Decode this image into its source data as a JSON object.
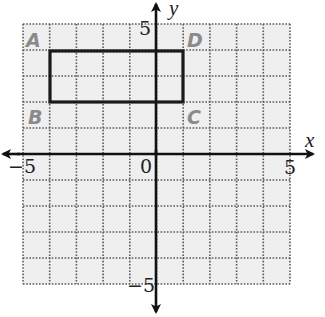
{
  "diagram": {
    "type": "coordinate-plane",
    "grid": {
      "x_range": [
        -5,
        5
      ],
      "y_range": [
        -5,
        5
      ],
      "step": 1,
      "background": "#efefef",
      "line_color": "#5a5a5a",
      "line_style": "dotted"
    },
    "axes": {
      "x_label": "x",
      "y_label": "y",
      "origin_label": "0",
      "x_min_label": "−5",
      "x_max_label": "5",
      "y_min_label": "−5",
      "y_max_label": "5",
      "color": "#111111"
    },
    "rectangle": {
      "stroke": "#1a1a1a",
      "corners": [
        {
          "x": -4,
          "y": 4
        },
        {
          "x": 1,
          "y": 4
        },
        {
          "x": 1,
          "y": 2
        },
        {
          "x": -4,
          "y": 2
        }
      ]
    },
    "vertex_labels": [
      {
        "text": "A",
        "x": -4.7,
        "y": 4.5
      },
      {
        "text": "B",
        "x": -4.7,
        "y": 1.5
      },
      {
        "text": "C",
        "x": 1.5,
        "y": 1.5
      },
      {
        "text": "D",
        "x": 1.5,
        "y": 4.5
      }
    ],
    "vertex_label_color": "#8a8a8a"
  }
}
